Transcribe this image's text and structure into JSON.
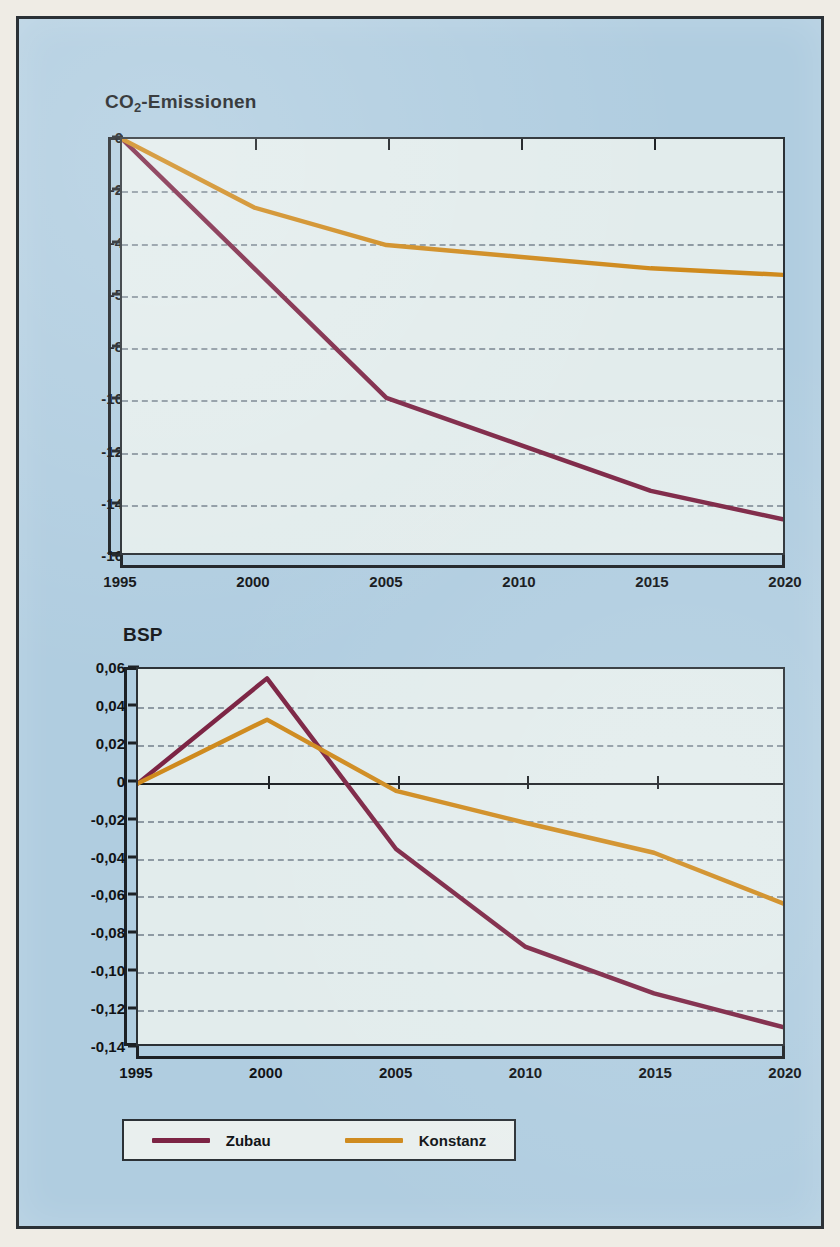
{
  "figure": {
    "background_color": "#b0cde0",
    "plot_background_color": "#e2ecec",
    "border_color": "#2b3136"
  },
  "series_colors": {
    "zubau": "#7c2444",
    "konstanz": "#cf8a1d"
  },
  "legend": {
    "entries": [
      {
        "label": "Zubau",
        "color": "#7c2444",
        "icon": "line-swatch"
      },
      {
        "label": "Konstanz",
        "color": "#cf8a1d",
        "icon": "line-swatch"
      }
    ]
  },
  "chart_data": [
    {
      "id": "co2",
      "type": "line",
      "title": "CO₂-Emissionen",
      "title_main": "CO",
      "title_sub": "2",
      "title_rest": "-Emissionen",
      "xlabel": "",
      "ylabel": "",
      "grid": true,
      "legend_position": "bottom-shared",
      "x": [
        1995,
        2000,
        2005,
        2010,
        2015,
        2020
      ],
      "xtick_labels": [
        "1995",
        "2000",
        "2005",
        "2010",
        "2015",
        "2020"
      ],
      "xlim": [
        1995,
        2020
      ],
      "ytick_labels": [
        "0",
        "-2",
        "-4",
        "-5",
        "-8",
        "-10",
        "-12",
        "-14",
        "-16"
      ],
      "ytick_positions": [
        0,
        1,
        2,
        3,
        4,
        5,
        6,
        7,
        8
      ],
      "ylim_slots": [
        0,
        8
      ],
      "note": "y tick labels are printed 0,-2,-4,-5,-8,-10,-12,-14,-16 at equal spacing (the -5 is a misprint for -6)",
      "series": [
        {
          "name": "Zubau",
          "color": "#7c2444",
          "values": [
            0,
            -5.0,
            -10.0,
            -11.8,
            -13.6,
            -14.7
          ],
          "values_slot": [
            0,
            2.5,
            5.0,
            5.9,
            6.8,
            7.35
          ]
        },
        {
          "name": "Konstanz",
          "color": "#cf8a1d",
          "values": [
            0,
            -2.65,
            -4.1,
            -4.55,
            -5.0,
            -5.25
          ],
          "values_slot": [
            0,
            1.325,
            2.05,
            2.275,
            2.5,
            2.625
          ]
        }
      ]
    },
    {
      "id": "bsp",
      "type": "line",
      "title": "BSP",
      "xlabel": "",
      "ylabel": "",
      "grid": true,
      "legend_position": "bottom-shared",
      "x": [
        1995,
        2000,
        2005,
        2010,
        2015,
        2020
      ],
      "xtick_labels": [
        "1995",
        "2000",
        "2005",
        "2010",
        "2015",
        "2020"
      ],
      "xlim": [
        1995,
        2020
      ],
      "ytick_labels": [
        "0,06",
        "0,04",
        "0,02",
        "0",
        "-0,02",
        "-0,04",
        "-0,06",
        "-0,08",
        "-0,10",
        "-0,12",
        "-0,14"
      ],
      "ytick_values": [
        0.06,
        0.04,
        0.02,
        0,
        -0.02,
        -0.04,
        -0.06,
        -0.08,
        -0.1,
        -0.12,
        -0.14
      ],
      "ylim": [
        -0.14,
        0.06
      ],
      "series": [
        {
          "name": "Zubau",
          "color": "#7c2444",
          "values": [
            -0.001,
            0.055,
            -0.036,
            -0.088,
            -0.113,
            -0.131
          ]
        },
        {
          "name": "Konstanz",
          "color": "#cf8a1d",
          "values": [
            -0.001,
            0.033,
            -0.005,
            -0.022,
            -0.038,
            -0.065
          ]
        }
      ]
    }
  ]
}
